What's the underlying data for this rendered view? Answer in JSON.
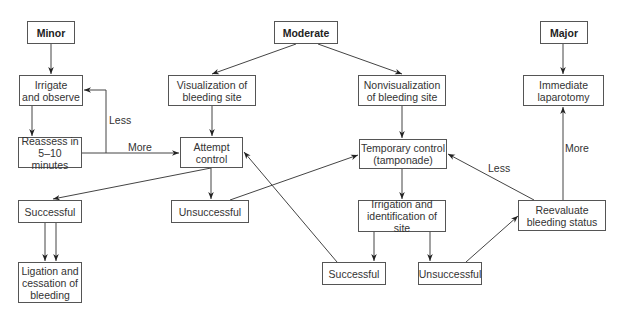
{
  "nodes": {
    "minor": {
      "text": "Minor",
      "x": 27,
      "y": 21,
      "w": 48,
      "h": 23,
      "bold": true
    },
    "irrigate": {
      "text": "Irrigate\nand observe",
      "x": 19,
      "y": 75,
      "w": 64,
      "h": 31
    },
    "reassess": {
      "text": "Reassess in\n5–10 minutes",
      "x": 18,
      "y": 137,
      "w": 64,
      "h": 31
    },
    "successful_left": {
      "text": "Successful",
      "x": 18,
      "y": 200,
      "w": 64,
      "h": 23
    },
    "ligation": {
      "text": "Ligation and\ncessation of\nbleeding",
      "x": 18,
      "y": 262,
      "w": 64,
      "h": 41
    },
    "moderate": {
      "text": "Moderate",
      "x": 274,
      "y": 21,
      "w": 64,
      "h": 23,
      "bold": true
    },
    "visualization": {
      "text": "Visualization of\nbleeding site",
      "x": 168,
      "y": 75,
      "w": 88,
      "h": 31
    },
    "attempt": {
      "text": "Attempt\ncontrol",
      "x": 180,
      "y": 137,
      "w": 63,
      "h": 31
    },
    "unsuccessful_left": {
      "text": "Unsuccessful",
      "x": 171,
      "y": 200,
      "w": 78,
      "h": 23
    },
    "nonvisualization": {
      "text": "Nonvisualization\nof bleeding site",
      "x": 358,
      "y": 75,
      "w": 88,
      "h": 31
    },
    "temporary": {
      "text": "Temporary control\n(tamponade)",
      "x": 359,
      "y": 139,
      "w": 88,
      "h": 30
    },
    "irrigation_id": {
      "text": "Irrigation and\nidentification of site",
      "x": 358,
      "y": 200,
      "w": 88,
      "h": 32
    },
    "successful_mid": {
      "text": "Successful",
      "x": 322,
      "y": 262,
      "w": 64,
      "h": 23
    },
    "unsuccessful_mid": {
      "text": "Unsuccessful",
      "x": 418,
      "y": 262,
      "w": 64,
      "h": 23
    },
    "major": {
      "text": "Major",
      "x": 540,
      "y": 21,
      "w": 48,
      "h": 23,
      "bold": true
    },
    "laparotomy": {
      "text": "Immediate\nlaparotomy",
      "x": 523,
      "y": 75,
      "w": 81,
      "h": 31
    },
    "reevaluate": {
      "text": "Reevaluate\nbleeding status",
      "x": 518,
      "y": 200,
      "w": 88,
      "h": 31
    }
  },
  "edge_labels": {
    "less_left": {
      "text": "Less",
      "x": 109,
      "y": 114
    },
    "more_left": {
      "text": "More",
      "x": 128,
      "y": 141
    },
    "less_right": {
      "text": "Less",
      "x": 488,
      "y": 162
    },
    "more_right": {
      "text": "More",
      "x": 565,
      "y": 142
    }
  },
  "edges": [
    {
      "id": "minor-irrigate",
      "points": [
        [
          51,
          44
        ],
        [
          51,
          74
        ]
      ]
    },
    {
      "id": "irrigate-reassess",
      "points": [
        [
          32,
          106
        ],
        [
          32,
          136
        ]
      ]
    },
    {
      "id": "reassess-less-irrigate",
      "points": [
        [
          106,
          153
        ],
        [
          106,
          90
        ],
        [
          84,
          90
        ]
      ]
    },
    {
      "id": "reassess-more-attempt",
      "points": [
        [
          82,
          153
        ],
        [
          179,
          153
        ]
      ]
    },
    {
      "id": "moderate-visualization",
      "points": [
        [
          296,
          44
        ],
        [
          212,
          74
        ]
      ]
    },
    {
      "id": "moderate-nonvisualization",
      "points": [
        [
          318,
          44
        ],
        [
          402,
          74
        ]
      ]
    },
    {
      "id": "visualization-attempt",
      "points": [
        [
          212,
          106
        ],
        [
          212,
          136
        ]
      ]
    },
    {
      "id": "nonvisualization-temporary",
      "points": [
        [
          402,
          106
        ],
        [
          402,
          138
        ]
      ]
    },
    {
      "id": "attempt-successful",
      "points": [
        [
          211,
          168
        ],
        [
          53,
          199
        ]
      ]
    },
    {
      "id": "attempt-unsuccessful",
      "points": [
        [
          211,
          168
        ],
        [
          211,
          199
        ]
      ]
    },
    {
      "id": "successful-ligation-a",
      "points": [
        [
          45,
          223
        ],
        [
          45,
          261
        ]
      ]
    },
    {
      "id": "successful-ligation-b",
      "points": [
        [
          56,
          223
        ],
        [
          56,
          261
        ]
      ]
    },
    {
      "id": "unsuccessful-temporary",
      "points": [
        [
          230,
          200
        ],
        [
          358,
          155
        ]
      ]
    },
    {
      "id": "successmid-attempt",
      "points": [
        [
          337,
          262
        ],
        [
          244,
          152
        ]
      ]
    },
    {
      "id": "temporary-irrigation",
      "points": [
        [
          402,
          169
        ],
        [
          402,
          199
        ]
      ]
    },
    {
      "id": "irrigation-successful",
      "points": [
        [
          374,
          232
        ],
        [
          374,
          261
        ]
      ]
    },
    {
      "id": "irrigation-unsuccessful",
      "points": [
        [
          430,
          232
        ],
        [
          430,
          261
        ]
      ]
    },
    {
      "id": "unsuccessmid-reevaluate",
      "points": [
        [
          466,
          262
        ],
        [
          518,
          216
        ]
      ]
    },
    {
      "id": "reevaluate-less-temporary",
      "points": [
        [
          534,
          200
        ],
        [
          448,
          154
        ]
      ]
    },
    {
      "id": "reevaluate-more-laparotomy",
      "points": [
        [
          563,
          200
        ],
        [
          563,
          107
        ]
      ]
    },
    {
      "id": "major-laparotomy",
      "points": [
        [
          563,
          44
        ],
        [
          563,
          74
        ]
      ]
    }
  ],
  "colors": {
    "stroke": "#444444",
    "text": "#333333"
  }
}
